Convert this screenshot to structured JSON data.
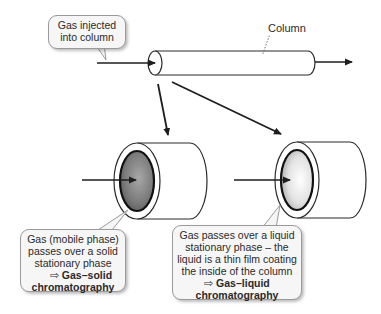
{
  "callouts": {
    "injected": {
      "line1": "Gas injected",
      "line2": "into column"
    },
    "solid": {
      "line1": "Gas (mobile phase)",
      "line2": "passes over a solid",
      "line3": "stationary phase",
      "arrow": "⇨",
      "result1": "Gas–solid",
      "result2": "chromatography"
    },
    "liquid": {
      "line1": "Gas passes over a liquid",
      "line2": "stationary phase – the",
      "line3": "liquid is a thin film coating",
      "line4": "the inside of the column",
      "arrow": "⇨",
      "result1": "Gas–liquid",
      "result2": "chromatography"
    }
  },
  "labels": {
    "column": "Column"
  },
  "colors": {
    "stroke": "#1e1e1e",
    "callout_bg": "#f6f6f6",
    "solid_phase": "#6e6e6e",
    "liquid_phase": "#d8d8d8"
  }
}
